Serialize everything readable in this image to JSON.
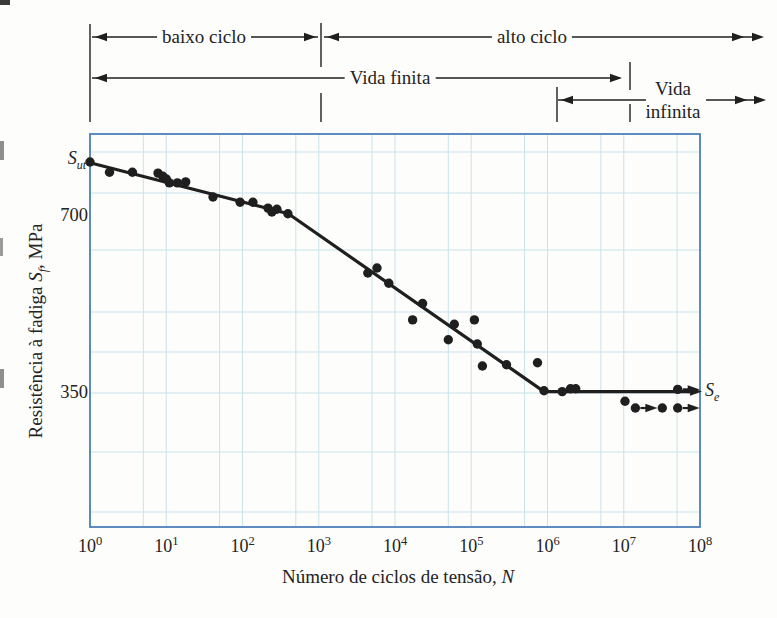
{
  "figure": {
    "regions": {
      "low_cycle_label": "baixo ciclo",
      "high_cycle_label": "alto ciclo",
      "finite_life_label": "Vida finita",
      "infinite_life_label_line1": "Vida",
      "infinite_life_label_line2": "infinita"
    },
    "y_axis": {
      "label_prefix": "Resistência à fadiga ",
      "label_symbol": "S",
      "label_symbol_sub": "f",
      "label_suffix": ", MPa",
      "tick_labels": [
        "700",
        "350"
      ]
    },
    "x_axis": {
      "label_prefix": "Número de ciclos de tensão, ",
      "label_symbol": "N",
      "tick_base": "10",
      "tick_exponents": [
        0,
        1,
        2,
        3,
        4,
        5,
        6,
        7,
        8
      ]
    },
    "markers": {
      "sut_symbol": "S",
      "sut_sub": "ut",
      "se_symbol": "S",
      "se_sub": "e"
    },
    "colors": {
      "ink": "#1f1f1f",
      "axis_blue": "#4d80b8",
      "grid_blue": "#c9e3ea",
      "background": "#fdfdfc"
    }
  },
  "chart_data": {
    "type": "scatter",
    "title": "",
    "xlabel": "Número de ciclos de tensão, N",
    "ylabel": "Resistência à fadiga Sf, MPa",
    "x_scale": "log",
    "y_scale": "log",
    "xlim": [
      1,
      100000000
    ],
    "ylim": [
      210,
      940
    ],
    "grid": true,
    "legend": "none",
    "xticks": [
      1,
      10,
      100,
      1000,
      10000,
      100000,
      1000000,
      10000000,
      100000000
    ],
    "yticks": [
      700,
      350
    ],
    "sut_mpa": 865,
    "se_mpa": 352,
    "points": [
      [
        1,
        865
      ],
      [
        1.8,
        831
      ],
      [
        3.6,
        831
      ],
      [
        7.8,
        828
      ],
      [
        9,
        818
      ],
      [
        10,
        809
      ],
      [
        11,
        797
      ],
      [
        14,
        797
      ],
      [
        18,
        800
      ],
      [
        41,
        754
      ],
      [
        93,
        739
      ],
      [
        137,
        739
      ],
      [
        216,
        722
      ],
      [
        243,
        711
      ],
      [
        283,
        719
      ],
      [
        394,
        706
      ],
      [
        4400,
        560
      ],
      [
        5800,
        571
      ],
      [
        8300,
        538
      ],
      [
        17000,
        466
      ],
      [
        23000,
        497
      ],
      [
        50000,
        431
      ],
      [
        60000,
        458
      ],
      [
        110000,
        466
      ],
      [
        120000,
        424
      ],
      [
        140000,
        389
      ],
      [
        290000,
        391
      ],
      [
        740000,
        394
      ],
      [
        900000,
        353
      ],
      [
        1560000,
        352
      ],
      [
        2000000,
        356
      ],
      [
        2340000,
        356
      ],
      [
        10400000,
        339
      ],
      [
        32000000,
        330
      ]
    ],
    "runout_points": [
      [
        14200000,
        330
      ],
      [
        51000000,
        355
      ],
      [
        51000000,
        330
      ]
    ],
    "fit_line": [
      [
        1,
        862
      ],
      [
        400,
        706
      ],
      [
        900000,
        352
      ]
    ],
    "endurance_line": {
      "S": 352,
      "from_N": 900000,
      "to_N": 80000000
    },
    "regions": {
      "low_cycle_N": [
        1,
        1000
      ],
      "high_cycle_N": [
        1000,
        100000000
      ],
      "finite_life_N": [
        1,
        10000000
      ],
      "infinite_life_from_N": 1000000
    }
  }
}
